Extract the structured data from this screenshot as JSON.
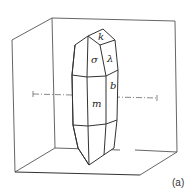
{
  "figure": {
    "caption": "(a)"
  },
  "faces": {
    "k": "k",
    "sigma": "σ",
    "lambda": "λ",
    "b": "b",
    "m": "m"
  },
  "colors": {
    "line": "#333333",
    "box_line": "#555555",
    "background": "#ffffff"
  }
}
